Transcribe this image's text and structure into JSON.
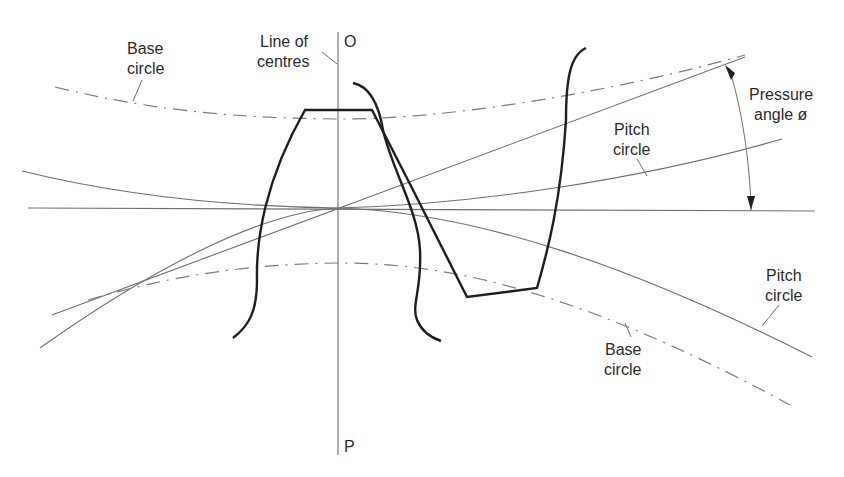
{
  "diagram": {
    "labels": {
      "base_circle_top_line1": "Base",
      "base_circle_top_line2": "circle",
      "line_of_centres_line1": "Line of",
      "line_of_centres_line2": "centres",
      "point_o": "O",
      "point_p": "P",
      "pressure_angle_line1": "Pressure",
      "pressure_angle_line2": "angle ø",
      "pitch_circle_upper_line1": "Pitch",
      "pitch_circle_upper_line2": "circle",
      "pitch_circle_lower_line1": "Pitch",
      "pitch_circle_lower_line2": "circle",
      "base_circle_bottom_line1": "Base",
      "base_circle_bottom_line2": "circle"
    },
    "elements": [
      "line-of-centres (vertical O–P)",
      "common tangent (horizontal)",
      "line of action (inclined at pressure angle)",
      "upper pitch circle",
      "lower pitch circle",
      "upper base circle (dash-dot)",
      "lower base circle (dash-dot)",
      "upper gear tooth",
      "lower gear tooth",
      "pressure angle arc with arrows"
    ],
    "colors": {
      "thin_line": "#6e6e6e",
      "tooth_outline": "#1e1e1e",
      "text": "#2a2a2a",
      "background": "#ffffff"
    }
  }
}
